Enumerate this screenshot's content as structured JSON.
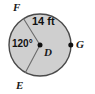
{
  "figure": {
    "type": "circle-with-central-angle",
    "caption_text": "Circle D with radius 14 ft and central angle FDE of 120 degrees, point G on the circle",
    "colors": {
      "background": "#ffffff",
      "circle_fill": "#cfcfcf",
      "circle_stroke": "#4a4a4a",
      "radius_stroke": "#6b6b6b",
      "point_fill": "#111111",
      "text": "#1a1a1a"
    },
    "circle": {
      "center_label": "D",
      "center_x": 40,
      "center_y": 45,
      "radius_px": 31
    },
    "points": [
      {
        "id": "point-F",
        "label": "F",
        "on_circle": true,
        "marker": false,
        "angle_deg": 122
      },
      {
        "id": "point-E",
        "label": "E",
        "on_circle": true,
        "marker": false,
        "angle_deg": 242
      },
      {
        "id": "point-G",
        "label": "G",
        "on_circle": true,
        "marker": true,
        "angle_deg": 0
      },
      {
        "id": "point-D",
        "label": "D",
        "on_circle": false,
        "marker": true,
        "angle_deg": null
      }
    ],
    "segments": [
      {
        "id": "segment-DF",
        "from": "D",
        "to": "F"
      },
      {
        "id": "segment-DE",
        "from": "D",
        "to": "E"
      }
    ],
    "measurements": {
      "radius_label": "14 ft",
      "radius_value": 14,
      "radius_unit": "ft",
      "central_angle_label": "120°",
      "central_angle_value": 120,
      "central_angle_unit": "degrees",
      "central_angle_vertex": "D",
      "central_angle_rays": [
        "F",
        "E"
      ]
    }
  }
}
